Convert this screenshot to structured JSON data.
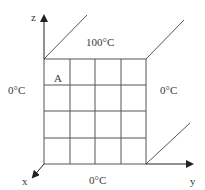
{
  "diagram": {
    "axes": {
      "z": "z",
      "x": "x",
      "y": "y"
    },
    "boundary_labels": {
      "top": "100°C",
      "left": "0°C",
      "right": "0°C",
      "bottom": "0°C"
    },
    "cell_label": "A",
    "grid": {
      "rows": 4,
      "cols": 4
    },
    "line_color": "#555555"
  }
}
